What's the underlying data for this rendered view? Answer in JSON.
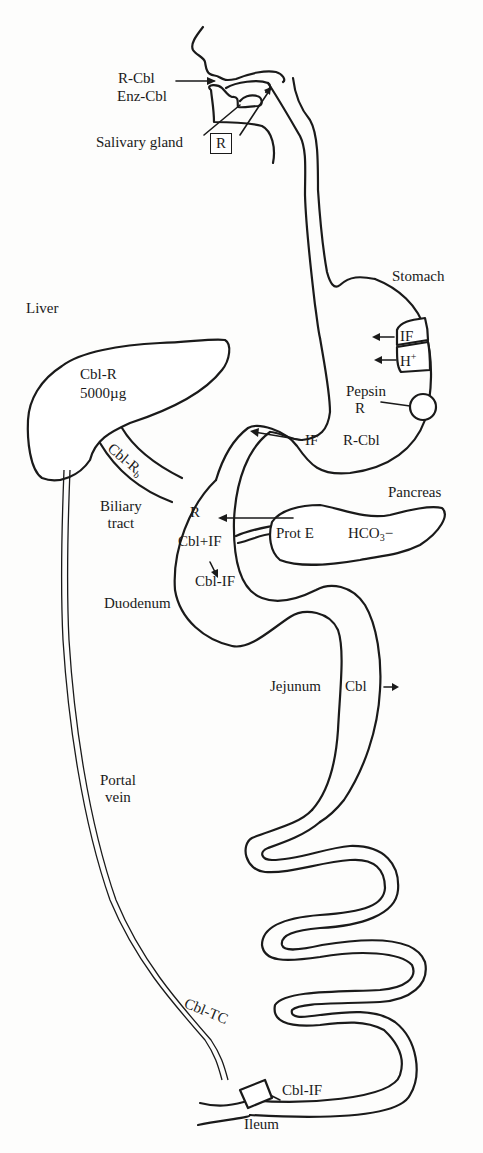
{
  "figure": {
    "type": "anatomical-diagram"
  },
  "labels": {
    "mouth": {
      "r_cbl": "R-Cbl",
      "enz_cbl": "Enz-Cbl",
      "salivary_gland": "Salivary gland",
      "salivary_box": "R"
    },
    "stomach": {
      "title": "Stomach",
      "if_cell": "IF",
      "h_plus_base": "H",
      "h_plus_sup": "+",
      "pepsin": "Pepsin",
      "r": "R",
      "r_cbl": "R-Cbl",
      "if_arrow": "IF"
    },
    "liver": {
      "title": "Liver",
      "cbl_r": "Cbl-R",
      "amount": "5000µg",
      "bile_base": "Cbl-R",
      "bile_sub": "b",
      "biliary_1": "Biliary",
      "biliary_2": "tract"
    },
    "pancreas": {
      "title": "Pancreas",
      "prot_e": "Prot E",
      "hco3_base": "HCO",
      "hco3_sub": "3",
      "hco3_charge": "−"
    },
    "duodenum": {
      "title": "Duodenum",
      "r": "R",
      "cbl_plus_if": "Cbl+IF",
      "cbl_if": "Cbl-IF"
    },
    "jejunum": {
      "title": "Jejunum",
      "cbl": "Cbl"
    },
    "portal": {
      "line1": "Portal",
      "line2": "vein",
      "cbl_tc": "Cbl-TC"
    },
    "ileum": {
      "title": "Ileum",
      "cbl_if": "Cbl-IF"
    }
  }
}
